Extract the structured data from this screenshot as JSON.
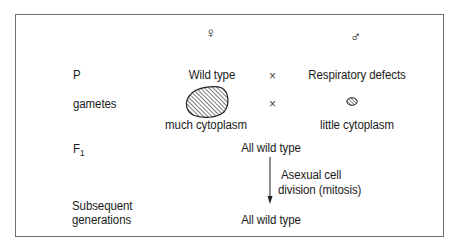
{
  "diagram": {
    "parents": {
      "female_symbol": "♀",
      "male_symbol": "♂",
      "row_label": "P",
      "female_phenotype": "Wild type",
      "male_phenotype": "Respiratory defects",
      "cross_symbol": "×"
    },
    "gametes": {
      "row_label": "gametes",
      "female_label": "much cytoplasm",
      "male_label": "little cytoplasm",
      "cross_symbol": "×"
    },
    "f1": {
      "row_label_main": "F",
      "row_label_sub": "1",
      "result": "All wild type"
    },
    "process": {
      "line1": "Asexual cell",
      "line2": "division (mitosis)"
    },
    "subsequent": {
      "row_label_line1": "Subsequent",
      "row_label_line2": "generations",
      "result": "All wild type"
    }
  }
}
